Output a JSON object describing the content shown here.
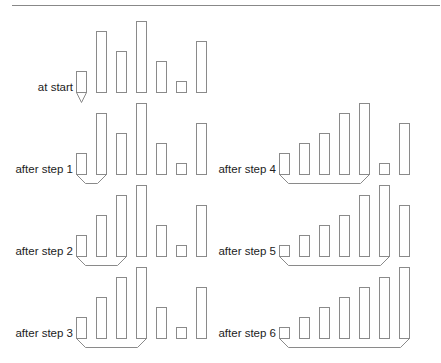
{
  "diagram": {
    "colors": {
      "rule": "#888888",
      "bar": "#8a8a8a",
      "bracket": "#8a8a8a",
      "text": "#222222"
    },
    "unit_height": 10,
    "bar_width": 10,
    "bar_spacing": 20,
    "panels": [
      {
        "label": "at start",
        "values": [
          2,
          6,
          4,
          7,
          3,
          1,
          5
        ],
        "sorted_count": 1,
        "x0": 76,
        "baseline": 92,
        "marker": "triangle"
      },
      {
        "label": "after step 1",
        "values": [
          2,
          6,
          4,
          7,
          3,
          1,
          5
        ],
        "sorted_count": 2,
        "x0": 76,
        "baseline": 174,
        "marker": "bracket"
      },
      {
        "label": "after step 2",
        "values": [
          2,
          4,
          6,
          7,
          3,
          1,
          5
        ],
        "sorted_count": 3,
        "x0": 76,
        "baseline": 256,
        "marker": "bracket"
      },
      {
        "label": "after step 3",
        "values": [
          2,
          4,
          6,
          7,
          3,
          1,
          5
        ],
        "sorted_count": 4,
        "x0": 76,
        "baseline": 338,
        "marker": "bracket"
      },
      {
        "label": "after step 4",
        "values": [
          2,
          3,
          4,
          6,
          7,
          1,
          5
        ],
        "sorted_count": 5,
        "x0": 279,
        "baseline": 174,
        "marker": "bracket"
      },
      {
        "label": "after step 5",
        "values": [
          1,
          2,
          3,
          4,
          6,
          7,
          5
        ],
        "sorted_count": 6,
        "x0": 279,
        "baseline": 256,
        "marker": "bracket"
      },
      {
        "label": "after step 6",
        "values": [
          1,
          2,
          3,
          4,
          5,
          6,
          7
        ],
        "sorted_count": 7,
        "x0": 279,
        "baseline": 338,
        "marker": "bracket"
      }
    ]
  }
}
